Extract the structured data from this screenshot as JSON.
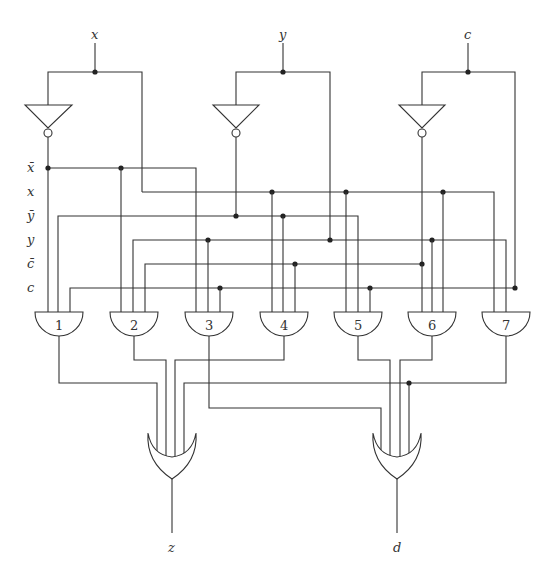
{
  "inputs": [
    {
      "name": "x",
      "x": 95,
      "rail": [
        48,
        142
      ]
    },
    {
      "name": "y",
      "x": 283,
      "rail": [
        236,
        330
      ]
    },
    {
      "name": "c",
      "x": 468,
      "rail": [
        422,
        515
      ]
    }
  ],
  "bus_labels": [
    "x̄",
    "x",
    "ȳ",
    "y",
    "c̄",
    "c"
  ],
  "bus_y": [
    168,
    192,
    216,
    240,
    264,
    288
  ],
  "and_gates": [
    {
      "label": "1",
      "cx": 59,
      "inputs": [
        "x̄",
        "ȳ",
        "c"
      ]
    },
    {
      "label": "2",
      "cx": 134,
      "inputs": [
        "x̄",
        "y",
        "c̄"
      ]
    },
    {
      "label": "3",
      "cx": 209,
      "inputs": [
        "x̄",
        "y",
        "c"
      ]
    },
    {
      "label": "4",
      "cx": 284,
      "inputs": [
        "x",
        "ȳ",
        "c̄"
      ]
    },
    {
      "label": "5",
      "cx": 358,
      "inputs": [
        "x",
        "ȳ",
        "c"
      ]
    },
    {
      "label": "6",
      "cx": 432,
      "inputs": [
        "x",
        "y",
        "c̄"
      ]
    },
    {
      "label": "7",
      "cx": 506,
      "inputs": [
        "x",
        "y",
        "c"
      ]
    }
  ],
  "or_gates": [
    {
      "output": "z",
      "cx": 172,
      "inputs_from": [
        "1",
        "2",
        "4",
        "7"
      ]
    },
    {
      "output": "d",
      "cx": 397,
      "inputs_from": [
        "3",
        "5",
        "6",
        "7"
      ]
    }
  ],
  "outputs": {
    "z": "z",
    "d": "d"
  }
}
